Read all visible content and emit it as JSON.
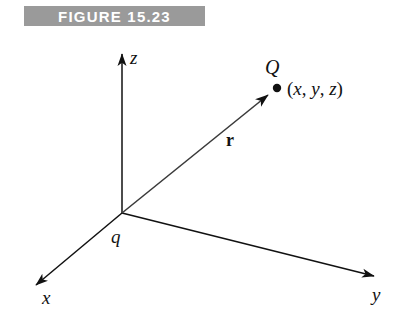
{
  "figure": {
    "banner_label": "FIGURE 15.23",
    "banner_color": "#9a9a9a",
    "banner_text_color": "#ffffff",
    "background_color": "#ffffff",
    "ink_color": "#111111"
  },
  "diagram": {
    "type": "3d-cartesian-axes-with-position-vector",
    "axes": [
      {
        "name": "x",
        "label": "x"
      },
      {
        "name": "y",
        "label": "y"
      },
      {
        "name": "z",
        "label": "z"
      }
    ],
    "origin": {
      "name": "charge-at-origin",
      "label": "q"
    },
    "point": {
      "name": "field-point",
      "label": "Q",
      "coordinates_label": "(x, y, z)",
      "coordinate_open": "(",
      "coordinate_close": ")",
      "coordinate_components": [
        "x",
        "y",
        "z"
      ],
      "coordinate_separator": ", "
    },
    "vector": {
      "name": "position-vector",
      "label": "r",
      "from": "q",
      "to": "Q"
    }
  }
}
